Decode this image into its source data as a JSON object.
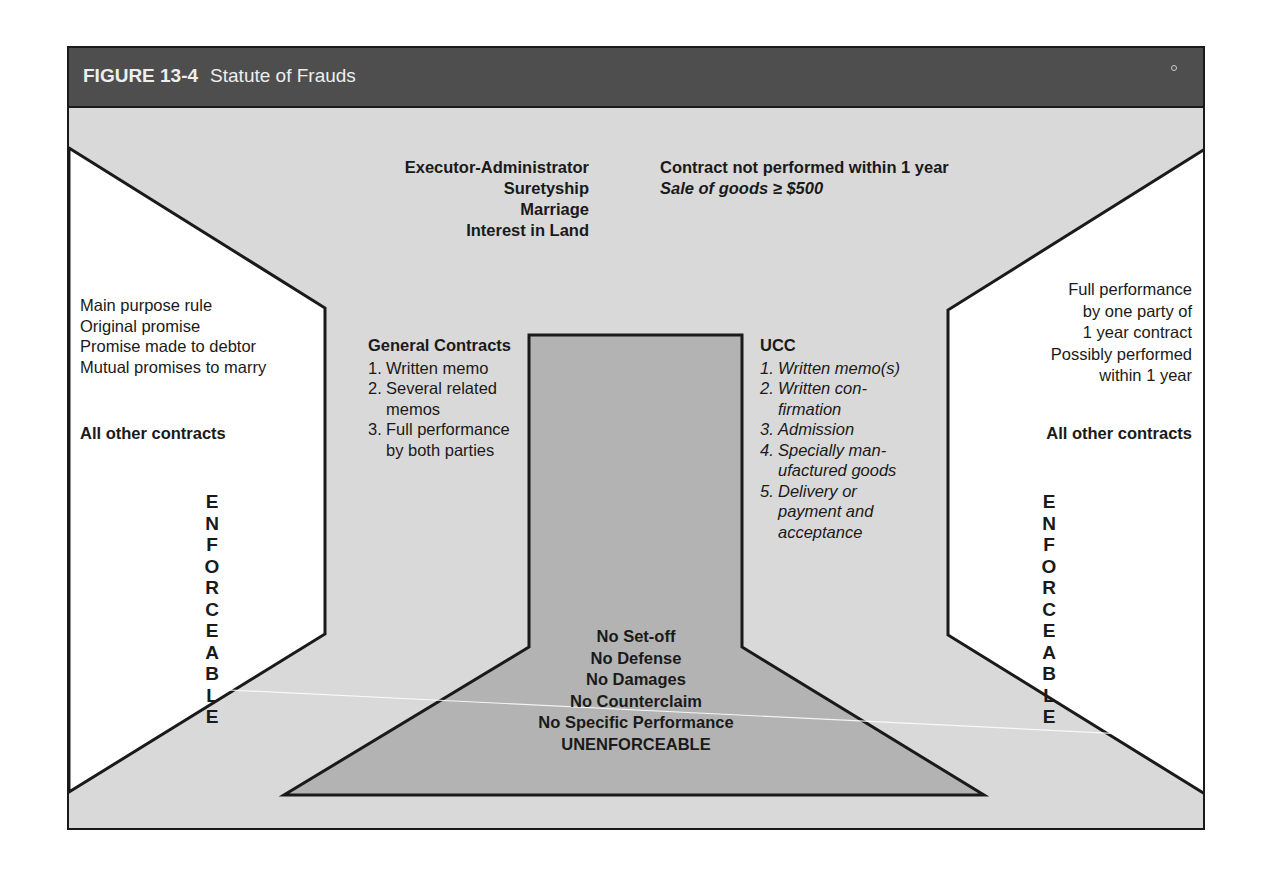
{
  "figure": {
    "number": "FIGURE 13-4",
    "title": "Statute of Frauds"
  },
  "top": {
    "left_lines": [
      "Executor-Administrator",
      "Suretyship",
      "Marriage",
      "Interest in Land"
    ],
    "right_bold": "Contract not performed within 1 year",
    "right_italic": "Sale of goods ≥ $500"
  },
  "left_panel": {
    "exceptions": [
      "Main purpose rule",
      "Original promise",
      "Promise made to debtor",
      "Mutual promises to marry"
    ],
    "other": "All other contracts",
    "vertical_label": "ENFORCEABLE"
  },
  "right_panel": {
    "exceptions": [
      "Full performance",
      "by one party of",
      "1 year contract",
      "Possibly performed",
      "within 1 year"
    ],
    "other": "All other contracts",
    "vertical_label": "ENFORCEABLE"
  },
  "general_contracts": {
    "heading": "General Contracts",
    "items": [
      {
        "n": "1.",
        "lines": [
          "Written memo"
        ]
      },
      {
        "n": "2.",
        "lines": [
          "Several related",
          "memos"
        ]
      },
      {
        "n": "3.",
        "lines": [
          "Full performance",
          "by both parties"
        ]
      }
    ]
  },
  "ucc": {
    "heading": "UCC",
    "items": [
      {
        "n": "1.",
        "lines": [
          "Written memo(s)"
        ]
      },
      {
        "n": "2.",
        "lines": [
          "Written con-",
          "firmation"
        ]
      },
      {
        "n": "3.",
        "lines": [
          "Admission"
        ]
      },
      {
        "n": "4.",
        "lines": [
          "Specially man-",
          "ufactured goods"
        ]
      },
      {
        "n": "5.",
        "lines": [
          "Delivery or",
          "payment and",
          "acceptance"
        ]
      }
    ]
  },
  "center": {
    "lines": [
      "No Set-off",
      "No Defense",
      "No Damages",
      "No Counterclaim",
      "No Specific Performance",
      "UNENFORCEABLE"
    ]
  },
  "colors": {
    "header_bg": "#4e4e4e",
    "background": "#d9d9d9",
    "panel": "#ffffff",
    "center_shape": "#b3b3b3",
    "stroke": "#1a1a1a"
  }
}
